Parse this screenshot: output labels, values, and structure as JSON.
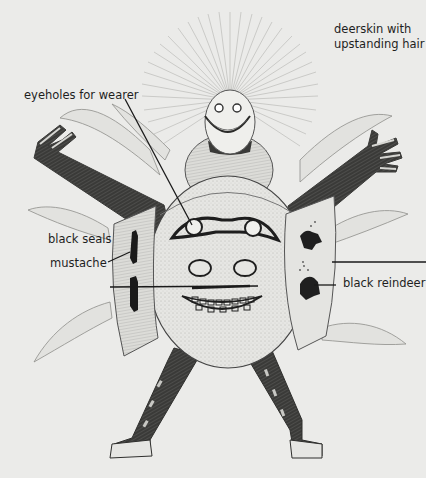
{
  "figure": {
    "background_color": "#ebebe9",
    "ink_color": "#1e1e1e"
  },
  "labels": {
    "deerskin": {
      "line1": "deerskin with",
      "line2": "upstanding hair"
    },
    "eyeholes": "eyeholes for wearer",
    "seals": "black seals",
    "mustache": "mustache",
    "reindeer": "black reindeer"
  },
  "leader_lines": [
    {
      "label": "eyeholes for wearer",
      "from": [
        125,
        99
      ],
      "to": [
        192,
        228
      ]
    },
    {
      "label": "black seals",
      "from": [
        108,
        264
      ],
      "to": [
        128,
        254
      ]
    },
    {
      "label": "mustache",
      "from": [
        110,
        287
      ],
      "to": [
        260,
        287
      ]
    },
    {
      "label": "black reindeer",
      "from": [
        314,
        285
      ],
      "to": [
        336,
        285
      ]
    },
    {
      "label": "unlabeled right pointer",
      "from": [
        333,
        262
      ],
      "to": [
        426,
        262
      ]
    }
  ]
}
